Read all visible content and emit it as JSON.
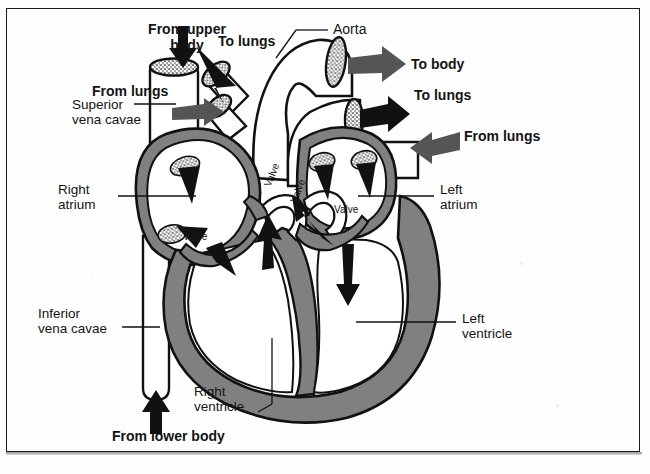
{
  "figure": {
    "frame": true,
    "background_color": "#fefefe",
    "wall_color": "#808080",
    "outline_color": "#111111",
    "chamber_fill": "#ffffff"
  },
  "labels": {
    "from_upper_body": "From upper\nbody",
    "to_lungs_top": "To lungs",
    "aorta": "Aorta",
    "to_body": "To body",
    "to_lungs_right": "To lungs",
    "from_lungs_left": "From lungs",
    "from_lungs_right": "From lungs",
    "superior_vena_cavae": "Superior\nvena cavae",
    "right_atrium": "Right\natrium",
    "left_atrium": "Left\natrium",
    "inferior_vena_cavae": "Inferior\nvena cavae",
    "left_ventricle": "Left\nventricle",
    "right_ventricle": "Right\nventricle",
    "from_lower_body": "From lower body"
  },
  "valve_labels": [
    {
      "id": "tricuspid",
      "text": "Valve",
      "rotation": 0
    },
    {
      "id": "pulmonary",
      "text": "Valve",
      "rotation": -68
    },
    {
      "id": "aortic",
      "text": "Valve",
      "rotation": -68
    },
    {
      "id": "mitral",
      "text": "Valve",
      "rotation": 0
    }
  ],
  "structures": [
    "superior vena cava",
    "inferior vena cava",
    "pulmonary artery",
    "pulmonary vein",
    "aorta",
    "right atrium",
    "left atrium",
    "right ventricle",
    "left ventricle",
    "interventricular septum"
  ],
  "flow_arrows": [
    {
      "name": "into-superior-vena-cava",
      "direction": "down"
    },
    {
      "name": "into-right-atrium-from-lungs",
      "direction": "right"
    },
    {
      "name": "out-to-lungs-upper",
      "direction": "up-left"
    },
    {
      "name": "out-to-body-aorta",
      "direction": "right"
    },
    {
      "name": "out-to-lungs-pulmonary",
      "direction": "right"
    },
    {
      "name": "into-left-atrium-from-lungs",
      "direction": "left"
    },
    {
      "name": "right-atrium-downward",
      "direction": "down"
    },
    {
      "name": "through-tricuspid-valve",
      "direction": "down-right"
    },
    {
      "name": "right-ventricle-upward",
      "direction": "up"
    },
    {
      "name": "left-atrium-downward",
      "direction": "down"
    },
    {
      "name": "through-mitral-valve",
      "direction": "up-left"
    },
    {
      "name": "into-inferior-vena-cava",
      "direction": "up"
    }
  ]
}
